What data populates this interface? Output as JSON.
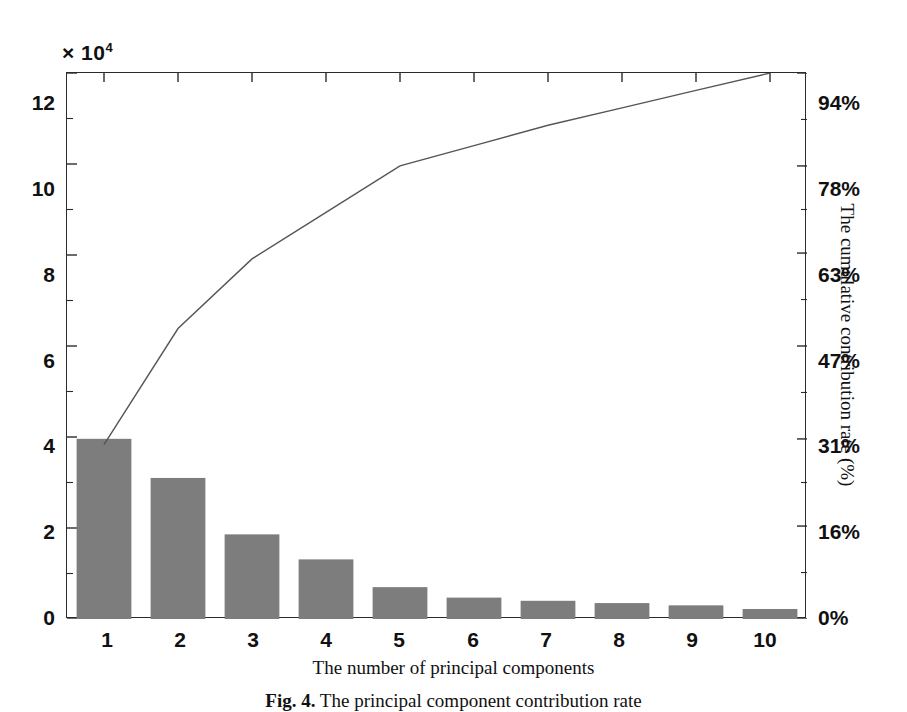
{
  "figure": {
    "caption_label": "Fig. 4.",
    "caption_text": "The principal component contribution rate",
    "exponent_prefix": "× 10",
    "exponent_power": "4"
  },
  "axes": {
    "x_title": "The number of principal components",
    "y_right_title": "The cumulative contribution rate (%)",
    "y_left_ticks": [
      "0",
      "2",
      "4",
      "6",
      "8",
      "10",
      "12"
    ],
    "y_right_ticks": [
      "0%",
      "16%",
      "31%",
      "47%",
      "63%",
      "78%",
      "94%"
    ],
    "x_ticks": [
      "1",
      "2",
      "3",
      "4",
      "5",
      "6",
      "7",
      "8",
      "9",
      "10"
    ]
  },
  "style": {
    "bar_color": "#7d7d7d",
    "line_color": "#555555",
    "axis_color": "#2b2b2b",
    "background": "#ffffff"
  },
  "chart_data": {
    "type": "bar",
    "title": "The principal component contribution rate",
    "xlabel": "The number of principal components",
    "ylabel": "× 10⁴",
    "y2label": "The cumulative contribution rate (%)",
    "categories": [
      "1",
      "2",
      "3",
      "4",
      "5",
      "6",
      "7",
      "8",
      "9",
      "10"
    ],
    "grid": false,
    "legend": "none",
    "ylim": [
      0,
      12
    ],
    "ytick_values": [
      0,
      2,
      4,
      6,
      8,
      10,
      12
    ],
    "y2lim": [
      0,
      94
    ],
    "y2tick_values": [
      0,
      16,
      31,
      47,
      63,
      78,
      94
    ],
    "series": [
      {
        "name": "Eigenvalue (×10⁴)",
        "type": "bar",
        "axis": "left",
        "values": [
          3.96,
          3.1,
          1.86,
          1.31,
          0.7,
          0.47,
          0.4,
          0.35,
          0.3,
          0.22
        ]
      },
      {
        "name": "Cumulative contribution rate (%)",
        "type": "line",
        "axis": "right",
        "values": [
          30,
          50,
          62,
          70,
          78,
          81.5,
          85,
          88,
          91,
          94
        ]
      }
    ]
  }
}
